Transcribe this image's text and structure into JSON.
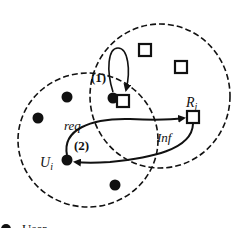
{
  "diagram": {
    "labels": {
      "step1": "(1)",
      "step2": "(2)",
      "req": "req",
      "inf": "Inf",
      "resource_main": "R",
      "resource_sub": "j",
      "user_main": "U",
      "user_sub": "i"
    },
    "legend": {
      "user_label": "User ..."
    },
    "colors": {
      "stroke": "#111111",
      "background": "#ffffff"
    },
    "nodes": {
      "users": [
        {
          "x": 67,
          "y": 97
        },
        {
          "x": 38,
          "y": 118
        },
        {
          "x": 67,
          "y": 160
        },
        {
          "x": 115,
          "y": 185
        },
        {
          "x": 113,
          "y": 98
        }
      ],
      "resources": [
        {
          "x": 145,
          "y": 50
        },
        {
          "x": 181,
          "y": 67
        },
        {
          "x": 123,
          "y": 101
        },
        {
          "x": 193,
          "y": 117
        }
      ]
    }
  }
}
